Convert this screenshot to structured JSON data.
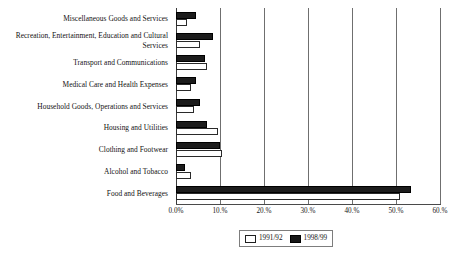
{
  "chart_data": {
    "type": "bar",
    "orientation": "horizontal",
    "title": "",
    "subtitle": "",
    "xlabel": "",
    "ylabel": "",
    "xlim": [
      0,
      60
    ],
    "grid": true,
    "grid_axis": "x",
    "legend_position": "bottom",
    "categories": [
      "Miscellaneous Goods and Services",
      "Recreation, Entertainment, Education and Cultural Services",
      "Transport and Communications",
      "Medical Care and Health Expenses",
      "Household Goods, Operations and Services",
      "Housing and Utilities",
      "Clothing and Footwear",
      "Alcohol and Tobacco",
      "Food and Beverages"
    ],
    "tick_labels": [
      "0.0%",
      "10.%",
      "20.%",
      "30.%",
      "40.%",
      "50.%",
      "60.%"
    ],
    "tick_values": [
      0,
      10,
      20,
      30,
      40,
      50,
      60
    ],
    "series": [
      {
        "name": "1991/92",
        "color": "#ffffff",
        "edge_color": "#2a2a2a",
        "values": [
          2.5,
          5.5,
          7.0,
          3.5,
          4.0,
          9.5,
          10.5,
          3.5,
          51.0
        ]
      },
      {
        "name": "1998/99",
        "color": "#1c1c1c",
        "edge_color": "#000000",
        "values": [
          4.5,
          8.5,
          6.5,
          4.5,
          5.5,
          7.0,
          10.0,
          2.0,
          53.5
        ]
      }
    ]
  },
  "legend": {
    "entries": [
      {
        "label": "1991/92"
      },
      {
        "label": "1998/99"
      }
    ]
  }
}
